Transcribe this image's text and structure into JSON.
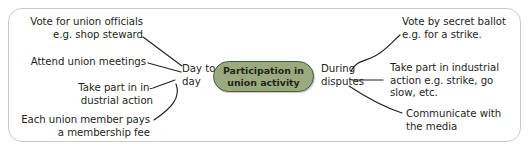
{
  "diagram": {
    "title": "Participation in union activity",
    "frame": {
      "border_color": "#c3ccc6",
      "background": "#ffffff"
    },
    "center_node": {
      "label": "Participation in\nunion activity",
      "fill_color": "#9aaa7e",
      "border_color": "#4c5b3c",
      "text_color": "#1e2616"
    },
    "branches": [
      {
        "name": "day-to-day",
        "label": "Day to\nday",
        "side": "left",
        "leaves": [
          {
            "name": "vote-for-union-officials",
            "text": "Vote for union officials\ne.g. shop steward"
          },
          {
            "name": "attend-union-meetings",
            "text": "Attend union meetings"
          },
          {
            "name": "take-part-in-industrial-action",
            "text": "Take part in in-\ndustrial action"
          },
          {
            "name": "membership-fee",
            "text": "Each union member pays\na membership fee"
          }
        ]
      },
      {
        "name": "during-disputes",
        "label": "During\ndisputes",
        "side": "right",
        "leaves": [
          {
            "name": "vote-by-secret-ballot",
            "text": "Vote by secret ballot\ne.g. for a strike."
          },
          {
            "name": "take-part-in-industrial-action-dispute",
            "text": "Take part in industrial\naction e.g. strike, go\nslow, etc."
          },
          {
            "name": "communicate-with-the-media",
            "text": "Communicate with\nthe media"
          }
        ]
      }
    ],
    "connector_color": "#231f20"
  }
}
